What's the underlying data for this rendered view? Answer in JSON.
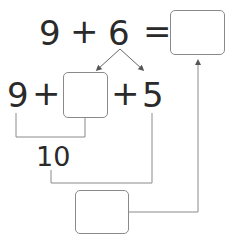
{
  "equation": {
    "left_operand": "9",
    "operator": "+",
    "right_operand": "6",
    "equals": "=",
    "answer_box": ""
  },
  "decomposition": {
    "first": "9",
    "plus1": "+",
    "split_box": "",
    "plus2": "+",
    "remainder": "5"
  },
  "make_ten": {
    "value": "10"
  },
  "final_box": "",
  "colors": {
    "text": "#2a2a2a",
    "lines": "#8a8a8a",
    "box_border": "#8a8a8a"
  }
}
